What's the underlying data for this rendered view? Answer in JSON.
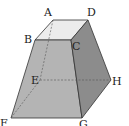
{
  "diagram": {
    "type": "frustum",
    "vertices": {
      "A": {
        "label": "A",
        "x": 53,
        "y": 20,
        "lx": 44,
        "ly": 16
      },
      "B": {
        "label": "B",
        "x": 35,
        "y": 40,
        "lx": 24,
        "ly": 43
      },
      "C": {
        "label": "C",
        "x": 71,
        "y": 40,
        "lx": 72,
        "ly": 50
      },
      "D": {
        "label": "D",
        "x": 88,
        "y": 20,
        "lx": 87,
        "ly": 16
      },
      "E": {
        "label": "E",
        "x": 40,
        "y": 80,
        "lx": 31,
        "ly": 84
      },
      "F": {
        "label": "F",
        "x": 11,
        "y": 118,
        "lx": 0,
        "ly": 127
      },
      "G": {
        "label": "G",
        "x": 82,
        "y": 118,
        "lx": 79,
        "ly": 128
      },
      "H": {
        "label": "H",
        "x": 111,
        "y": 80,
        "lx": 112,
        "ly": 85
      }
    },
    "colors": {
      "top": "#ececec",
      "front": "#b4b4b4",
      "right": "#8c8c8c",
      "edge": "#333333",
      "hidden": "#555555"
    },
    "hidden_edges": [
      "A-E",
      "E-F",
      "E-H"
    ]
  }
}
